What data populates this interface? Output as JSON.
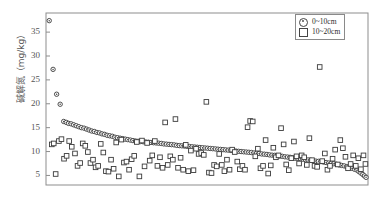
{
  "chart_data": {
    "type": "scatter",
    "title": "",
    "xlabel": "",
    "ylabel": "碱解氮（mg/kg）",
    "ylim": [
      3,
      39
    ],
    "xlim": [
      0,
      100
    ],
    "yticks": [
      5,
      10,
      15,
      20,
      25,
      30,
      35
    ],
    "xticks": [],
    "grid": false,
    "legend_position": "top-right",
    "frame": true,
    "series": [
      {
        "name": "0~10cm",
        "marker": "circle",
        "color": "#3a3a3a",
        "points": [
          [
            1.0,
            37.4
          ],
          [
            2.2,
            27.2
          ],
          [
            3.3,
            22.0
          ],
          [
            4.4,
            19.9
          ],
          [
            5.5,
            16.3
          ],
          [
            6.3,
            16.1
          ],
          [
            7.0,
            15.9
          ],
          [
            7.8,
            15.8
          ],
          [
            8.6,
            15.6
          ],
          [
            9.4,
            15.4
          ],
          [
            10.2,
            15.2
          ],
          [
            11.0,
            15.0
          ],
          [
            11.8,
            14.9
          ],
          [
            12.6,
            14.7
          ],
          [
            13.4,
            14.5
          ],
          [
            14.2,
            14.3
          ],
          [
            15.0,
            14.2
          ],
          [
            15.8,
            14.0
          ],
          [
            16.6,
            13.9
          ],
          [
            17.4,
            13.7
          ],
          [
            18.2,
            13.6
          ],
          [
            19.0,
            13.4
          ],
          [
            19.8,
            13.3
          ],
          [
            20.6,
            13.2
          ],
          [
            21.4,
            13.0
          ],
          [
            22.2,
            12.9
          ],
          [
            23.0,
            12.8
          ],
          [
            23.8,
            12.7
          ],
          [
            24.6,
            12.6
          ],
          [
            25.4,
            12.5
          ],
          [
            26.2,
            12.4
          ],
          [
            27.0,
            12.3
          ],
          [
            27.8,
            12.2
          ],
          [
            28.6,
            12.15
          ],
          [
            29.4,
            12.1
          ],
          [
            30.2,
            12.05
          ],
          [
            31.0,
            12.0
          ],
          [
            31.8,
            11.95
          ],
          [
            32.6,
            11.9
          ],
          [
            33.4,
            11.85
          ],
          [
            34.2,
            11.8
          ],
          [
            35.0,
            11.75
          ],
          [
            35.8,
            11.7
          ],
          [
            36.6,
            11.6
          ],
          [
            37.4,
            11.55
          ],
          [
            38.2,
            11.5
          ],
          [
            39.0,
            11.45
          ],
          [
            39.8,
            11.4
          ],
          [
            40.6,
            11.3
          ],
          [
            41.4,
            11.25
          ],
          [
            42.2,
            11.2
          ],
          [
            43.0,
            11.15
          ],
          [
            43.8,
            11.1
          ],
          [
            44.6,
            11.05
          ],
          [
            45.4,
            11.0
          ],
          [
            46.2,
            10.95
          ],
          [
            47.0,
            10.9
          ],
          [
            47.8,
            10.85
          ],
          [
            48.6,
            10.8
          ],
          [
            49.4,
            10.75
          ],
          [
            50.2,
            10.7
          ],
          [
            51.0,
            10.65
          ],
          [
            51.8,
            10.6
          ],
          [
            52.6,
            10.55
          ],
          [
            53.4,
            10.5
          ],
          [
            54.2,
            10.45
          ],
          [
            55.0,
            10.4
          ],
          [
            55.8,
            10.35
          ],
          [
            56.6,
            10.3
          ],
          [
            57.4,
            10.25
          ],
          [
            58.2,
            10.2
          ],
          [
            59.0,
            10.1
          ],
          [
            59.8,
            10.05
          ],
          [
            60.6,
            10.0
          ],
          [
            61.4,
            9.95
          ],
          [
            62.2,
            9.9
          ],
          [
            63.0,
            9.85
          ],
          [
            63.8,
            9.8
          ],
          [
            64.6,
            9.7
          ],
          [
            65.4,
            9.65
          ],
          [
            66.2,
            9.6
          ],
          [
            67.0,
            9.5
          ],
          [
            67.8,
            9.45
          ],
          [
            68.6,
            9.4
          ],
          [
            69.4,
            9.3
          ],
          [
            70.2,
            9.25
          ],
          [
            71.0,
            9.2
          ],
          [
            71.8,
            9.1
          ],
          [
            72.6,
            9.05
          ],
          [
            73.4,
            9.0
          ],
          [
            74.2,
            8.9
          ],
          [
            75.0,
            8.85
          ],
          [
            75.8,
            8.8
          ],
          [
            76.6,
            8.7
          ],
          [
            77.4,
            8.6
          ],
          [
            78.2,
            8.55
          ],
          [
            79.0,
            8.5
          ],
          [
            79.8,
            8.4
          ],
          [
            80.6,
            8.3
          ],
          [
            81.4,
            8.25
          ],
          [
            82.2,
            8.2
          ],
          [
            83.0,
            8.1
          ],
          [
            83.8,
            8.0
          ],
          [
            84.6,
            7.95
          ],
          [
            85.4,
            7.9
          ],
          [
            86.2,
            7.8
          ],
          [
            87.0,
            7.7
          ],
          [
            87.8,
            7.6
          ],
          [
            88.6,
            7.55
          ],
          [
            89.4,
            7.45
          ],
          [
            90.2,
            7.35
          ],
          [
            91.0,
            7.2
          ],
          [
            91.8,
            7.1
          ],
          [
            92.6,
            7.0
          ],
          [
            93.4,
            6.85
          ],
          [
            94.2,
            6.7
          ],
          [
            95.0,
            6.5
          ],
          [
            95.8,
            6.3
          ],
          [
            96.6,
            6.1
          ],
          [
            97.2,
            5.8
          ],
          [
            97.8,
            5.5
          ],
          [
            98.4,
            5.2
          ],
          [
            98.9,
            4.9
          ],
          [
            99.4,
            4.6
          ]
        ]
      },
      {
        "name": "10~20cm",
        "marker": "square",
        "color": "#3a3a3a",
        "points": [
          [
            1.8,
            11.5
          ],
          [
            2.4,
            11.7
          ],
          [
            3.0,
            5.3
          ],
          [
            4.0,
            12.2
          ],
          [
            4.8,
            12.6
          ],
          [
            5.6,
            8.5
          ],
          [
            6.4,
            9.1
          ],
          [
            7.2,
            12.2
          ],
          [
            8.0,
            11.0
          ],
          [
            9.0,
            9.6
          ],
          [
            9.8,
            7.0
          ],
          [
            10.6,
            7.6
          ],
          [
            11.4,
            11.7
          ],
          [
            12.2,
            11.2
          ],
          [
            13.0,
            9.9
          ],
          [
            13.8,
            7.6
          ],
          [
            14.6,
            8.3
          ],
          [
            15.4,
            6.7
          ],
          [
            16.2,
            7.0
          ],
          [
            17.0,
            11.6
          ],
          [
            17.8,
            9.8
          ],
          [
            18.6,
            5.9
          ],
          [
            19.4,
            5.8
          ],
          [
            20.2,
            8.3
          ],
          [
            21.0,
            6.4
          ],
          [
            21.8,
            11.9
          ],
          [
            22.6,
            4.8
          ],
          [
            23.4,
            12.5
          ],
          [
            24.2,
            7.7
          ],
          [
            25.0,
            7.9
          ],
          [
            25.8,
            6.2
          ],
          [
            26.6,
            8.4
          ],
          [
            27.4,
            9.1
          ],
          [
            28.2,
            12.0
          ],
          [
            29.0,
            4.8
          ],
          [
            29.8,
            12.3
          ],
          [
            30.6,
            6.9
          ],
          [
            31.4,
            11.8
          ],
          [
            32.2,
            8.1
          ],
          [
            33.0,
            9.2
          ],
          [
            33.8,
            12.2
          ],
          [
            34.6,
            7.0
          ],
          [
            35.4,
            8.8
          ],
          [
            36.2,
            6.6
          ],
          [
            37.0,
            16.1
          ],
          [
            37.8,
            7.2
          ],
          [
            38.6,
            9.0
          ],
          [
            39.4,
            8.3
          ],
          [
            40.2,
            16.8
          ],
          [
            41.0,
            6.6
          ],
          [
            41.8,
            8.7
          ],
          [
            42.6,
            6.2
          ],
          [
            43.4,
            11.4
          ],
          [
            44.2,
            5.9
          ],
          [
            45.0,
            10.2
          ],
          [
            45.8,
            6.1
          ],
          [
            46.6,
            10.6
          ],
          [
            47.4,
            9.5
          ],
          [
            48.2,
            9.7
          ],
          [
            49.0,
            9.3
          ],
          [
            49.8,
            20.4
          ],
          [
            50.6,
            5.6
          ],
          [
            51.4,
            5.5
          ],
          [
            52.2,
            7.2
          ],
          [
            53.0,
            6.9
          ],
          [
            53.8,
            9.5
          ],
          [
            54.6,
            7.2
          ],
          [
            55.4,
            5.9
          ],
          [
            56.2,
            8.3
          ],
          [
            57.0,
            6.2
          ],
          [
            57.8,
            10.4
          ],
          [
            58.6,
            9.9
          ],
          [
            59.4,
            7.9
          ],
          [
            60.2,
            6.3
          ],
          [
            61.0,
            7.0
          ],
          [
            61.8,
            6.2
          ],
          [
            62.6,
            15.1
          ],
          [
            63.4,
            16.4
          ],
          [
            64.2,
            16.3
          ],
          [
            65.0,
            9.0
          ],
          [
            65.8,
            10.6
          ],
          [
            66.6,
            6.5
          ],
          [
            67.4,
            7.0
          ],
          [
            68.2,
            12.4
          ],
          [
            69.0,
            5.4
          ],
          [
            69.8,
            7.1
          ],
          [
            70.6,
            10.8
          ],
          [
            71.4,
            8.8
          ],
          [
            72.2,
            9.2
          ],
          [
            73.0,
            14.9
          ],
          [
            73.8,
            11.5
          ],
          [
            74.6,
            7.3
          ],
          [
            75.4,
            6.1
          ],
          [
            76.2,
            8.6
          ],
          [
            77.0,
            12.1
          ],
          [
            77.8,
            9.0
          ],
          [
            78.6,
            7.5
          ],
          [
            79.4,
            9.2
          ],
          [
            80.2,
            8.8
          ],
          [
            81.0,
            7.2
          ],
          [
            81.8,
            12.8
          ],
          [
            82.6,
            8.2
          ],
          [
            83.4,
            7.0
          ],
          [
            84.2,
            6.8
          ],
          [
            85.0,
            27.7
          ],
          [
            85.8,
            8.0
          ],
          [
            86.6,
            9.6
          ],
          [
            87.4,
            6.2
          ],
          [
            88.2,
            7.0
          ],
          [
            89.0,
            8.5
          ],
          [
            89.8,
            10.4
          ],
          [
            90.6,
            7.3
          ],
          [
            91.4,
            12.4
          ],
          [
            92.2,
            10.7
          ],
          [
            93.0,
            8.9
          ],
          [
            93.8,
            6.5
          ],
          [
            94.6,
            7.4
          ],
          [
            95.4,
            9.2
          ],
          [
            96.2,
            7.0
          ],
          [
            97.0,
            8.6
          ],
          [
            97.8,
            6.3
          ],
          [
            98.6,
            9.2
          ],
          [
            99.2,
            7.4
          ]
        ]
      }
    ],
    "legend": [
      {
        "label": "0~10cm",
        "marker": "circle"
      },
      {
        "label": "10~20cm",
        "marker": "square"
      }
    ]
  }
}
